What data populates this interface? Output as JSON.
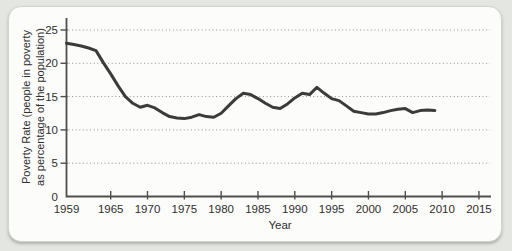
{
  "colors": {
    "page_background": "#e4e6e2",
    "card_background": "#fcfcfb",
    "card_border": "#d2d4cf",
    "axis": "#4f4f4f",
    "gridline": "#8f8f8f",
    "text": "#2e2e2e",
    "series_line": "#3b3b3b"
  },
  "chart_data": {
    "type": "line",
    "title": "",
    "xlabel": "Year",
    "ylabel": "Poverty Rate (people in poverty as percentage of the population)",
    "ylabel_lines": [
      "Poverty Rate (people in poverty",
      "as percentage of the population)"
    ],
    "x_ticks": [
      1959,
      1965,
      1970,
      1975,
      1980,
      1985,
      1990,
      1995,
      2000,
      2005,
      2010,
      2015
    ],
    "y_ticks": [
      0,
      5,
      10,
      15,
      20,
      25
    ],
    "xlim": [
      1959,
      2016.5
    ],
    "ylim": [
      0,
      26.8
    ],
    "grid": "horizontal dotted gridlines at each y tick above 0",
    "legend": "none",
    "series": [
      {
        "name": "poverty_rate",
        "color": "#3b3b3b",
        "x": [
          1959,
          1960,
          1961,
          1962,
          1963,
          1964,
          1965,
          1966,
          1967,
          1968,
          1969,
          1970,
          1971,
          1972,
          1973,
          1974,
          1975,
          1976,
          1977,
          1978,
          1979,
          1980,
          1981,
          1982,
          1983,
          1984,
          1985,
          1986,
          1987,
          1988,
          1989,
          1990,
          1991,
          1992,
          1993,
          1994,
          1995,
          1996,
          1997,
          1998,
          1999,
          2000,
          2001,
          2002,
          2003,
          2004,
          2005,
          2006,
          2007,
          2008,
          2009
        ],
        "y": [
          23.0,
          22.8,
          22.6,
          22.3,
          21.9,
          20.1,
          18.4,
          16.6,
          15.0,
          14.0,
          13.4,
          13.7,
          13.3,
          12.6,
          12.0,
          11.8,
          11.7,
          11.9,
          12.3,
          12.0,
          11.9,
          12.5,
          13.6,
          14.7,
          15.5,
          15.3,
          14.7,
          14.0,
          13.4,
          13.2,
          13.9,
          14.8,
          15.5,
          15.3,
          16.4,
          15.5,
          14.7,
          14.4,
          13.6,
          12.8,
          12.6,
          12.4,
          12.4,
          12.6,
          12.9,
          13.1,
          13.2,
          12.6,
          12.9,
          13.0,
          12.9
        ]
      }
    ]
  }
}
